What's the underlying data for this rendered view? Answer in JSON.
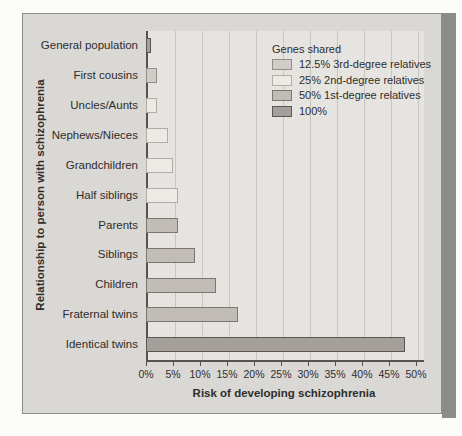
{
  "chart_data": {
    "type": "bar",
    "orientation": "horizontal",
    "title": "",
    "xlabel": "Risk of developing schizophrenia",
    "ylabel": "Relationship to person with schizophrenia",
    "xlim": [
      0,
      51
    ],
    "x_tick_values": [
      0,
      5,
      10,
      15,
      20,
      25,
      30,
      35,
      40,
      45,
      50
    ],
    "x_tick_labels": [
      "0%",
      "5%",
      "10%",
      "15%",
      "20%",
      "25%",
      "30%",
      "35%",
      "40%",
      "45%",
      "50%"
    ],
    "grid": "vertical gridlines every 5%",
    "legend_position": "top-right inside plot",
    "categories": [
      "General population",
      "First cousins",
      "Uncles/Aunts",
      "Nephews/Nieces",
      "Grandchildren",
      "Half siblings",
      "Parents",
      "Siblings",
      "Children",
      "Fraternal twins",
      "Identical twins"
    ],
    "values": [
      1,
      2,
      2,
      4,
      5,
      6,
      6,
      9,
      13,
      17,
      48
    ],
    "groups": [
      "100",
      "3rd",
      "2nd",
      "2nd",
      "2nd",
      "2nd",
      "1st",
      "1st",
      "1st",
      "1st",
      "100"
    ],
    "legend": {
      "title": "Genes shared",
      "items": [
        {
          "key": "3rd",
          "label": "12.5% 3rd-degree relatives",
          "fill": "#d2ccc7",
          "border": "#928d88"
        },
        {
          "key": "2nd",
          "label": "25% 2nd-degree relatives",
          "fill": "#eceae5",
          "border": "#b0aca6"
        },
        {
          "key": "1st",
          "label": "50% 1st-degree relatives",
          "fill": "#c2bcb7",
          "border": "#7b766f"
        },
        {
          "key": "100",
          "label": "100%",
          "fill": "#a49f9b",
          "border": "#5b5753"
        }
      ]
    }
  },
  "colors": {
    "page_background": "#fcfcfa",
    "panel_background": "#dad8d5",
    "panel_border": "#8f8d8b",
    "plot_background": "#e6e4e1",
    "gridline": "#c9c6c2",
    "axis_line": "#56524e",
    "text": "#2f2d2b",
    "page_edge_strip": "#8c8c8a"
  }
}
